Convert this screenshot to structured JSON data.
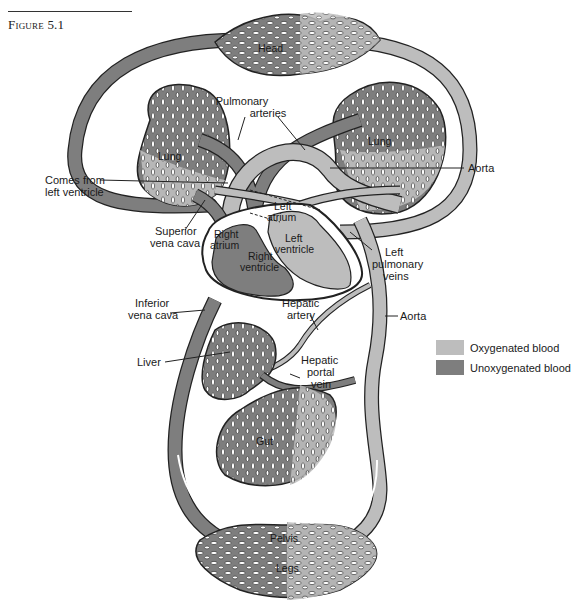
{
  "figure": {
    "caption": "Figure 5.1"
  },
  "colors": {
    "oxygenated": "#bdbdbd",
    "unoxygenated": "#7e7e7e",
    "outline": "#222222",
    "background": "#ffffff"
  },
  "legend": {
    "items": [
      {
        "label": "Oxygenated blood",
        "color": "#bdbdbd"
      },
      {
        "label": "Unoxygenated blood",
        "color": "#7e7e7e"
      }
    ]
  },
  "labels": {
    "head": "Head",
    "pulmonary_arteries_1": "Pulmonary",
    "pulmonary_arteries_2": "arteries",
    "lung_left": "Lung",
    "lung_right": "Lung",
    "aorta_top": "Aorta",
    "comes_from_1": "Comes from",
    "comes_from_2": "left ventricle",
    "left_atrium_1": "Left",
    "left_atrium_2": "atrium",
    "left_ventricle_1": "Left",
    "left_ventricle_2": "ventricle",
    "right_atrium_1": "Right",
    "right_atrium_2": "atrium",
    "right_ventricle_1": "Right",
    "right_ventricle_2": "ventricle",
    "superior_vc_1": "Superior",
    "superior_vc_2": "vena cava",
    "left_pulm_veins_1": "Left",
    "left_pulm_veins_2": "pulmonary",
    "left_pulm_veins_3": "veins",
    "inferior_vc_1": "Inferior",
    "inferior_vc_2": "vena cava",
    "hepatic_artery_1": "Hepatic",
    "hepatic_artery_2": "artery",
    "aorta_mid": "Aorta",
    "liver": "Liver",
    "hepatic_portal_1": "Hepatic",
    "hepatic_portal_2": "portal",
    "hepatic_portal_3": "vein",
    "gut": "Gut",
    "pelvis": "Pelvis",
    "legs": "Legs"
  }
}
